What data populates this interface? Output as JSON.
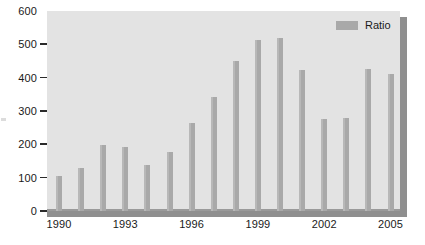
{
  "chart_data": {
    "type": "bar",
    "title": "",
    "xlabel": "",
    "ylabel": "",
    "categories": [
      "1990",
      "1991",
      "1992",
      "1993",
      "1994",
      "1995",
      "1996",
      "1997",
      "1998",
      "1999",
      "2000",
      "2001",
      "2002",
      "2003",
      "2004",
      "2005"
    ],
    "values": [
      105,
      130,
      198,
      192,
      137,
      178,
      263,
      342,
      450,
      512,
      520,
      424,
      275,
      280,
      425,
      410
    ],
    "series": [
      {
        "name": "Ratio",
        "values": [
          105,
          130,
          198,
          192,
          137,
          178,
          263,
          342,
          450,
          512,
          520,
          424,
          275,
          280,
          425,
          410
        ]
      }
    ],
    "ylim": [
      0,
      600
    ],
    "y_ticks": [
      0,
      100,
      200,
      300,
      400,
      500,
      600
    ],
    "y_tick_labels": [
      "0",
      "100",
      "200",
      "300",
      "400",
      "500",
      "600"
    ],
    "x_tick_labels": [
      "1990",
      "1993",
      "1996",
      "1999",
      "2002",
      "2005"
    ],
    "x_tick_categories": [
      "1990",
      "1993",
      "1996",
      "1999",
      "2002",
      "2005"
    ],
    "grid": false,
    "legend_position": "top-right",
    "colors": {
      "bar": "#a9a9a9",
      "bar_highlight": "#b8b8b8",
      "panel_background": "#e3e3e3",
      "panel_shadow": "#8f8f8f",
      "axis_text": "#1a1a1a",
      "page_background": "#ffffff"
    }
  },
  "legend": {
    "entries": [
      {
        "label": "Ratio",
        "color": "#a9a9a9"
      }
    ]
  }
}
